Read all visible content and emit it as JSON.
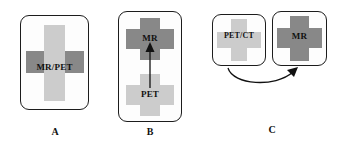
{
  "figure": {
    "background": "#ffffff",
    "colors": {
      "light_gray": "#cccccc",
      "dark_gray": "#888888",
      "outline": "#1c1c1c",
      "text": "#111111",
      "box_fill": "#fdfdfd"
    }
  },
  "panels": [
    {
      "letter": "A",
      "name": "integrated-mr-pet",
      "caption": "A",
      "box": {
        "x": 20,
        "y": 15,
        "w": 69,
        "h": 95
      },
      "crosses": [
        {
          "name": "mr-pet-cross",
          "label": "MR/PET",
          "label_color": "#111111",
          "vertical_color": "#cccccc",
          "horizontal_color": "#888888",
          "order": "vertical-on-top"
        }
      ]
    },
    {
      "letter": "B",
      "name": "sequential-mr-pet",
      "caption": "B",
      "box": {
        "x": 118,
        "y": 11,
        "w": 64,
        "h": 111
      },
      "crosses": [
        {
          "name": "mr-cross",
          "label": "MR",
          "color": "#888888",
          "position": "top"
        },
        {
          "name": "pet-cross",
          "label": "PET",
          "color": "#cccccc",
          "position": "bottom"
        }
      ],
      "arrow": {
        "name": "pet-to-mr-arrow",
        "direction": "up",
        "style": "straight"
      }
    },
    {
      "letter": "C",
      "name": "separate-petct-and-mr",
      "caption": "C",
      "boxes": [
        {
          "name": "petct-box",
          "x": 212,
          "y": 14,
          "w": 54,
          "h": 52
        },
        {
          "name": "mr-box",
          "x": 272,
          "y": 11,
          "w": 55,
          "h": 55
        }
      ],
      "crosses": [
        {
          "name": "petct-cross",
          "label": "PET/CT",
          "color": "#cccccc"
        },
        {
          "name": "mr-cross",
          "label": "MR",
          "color": "#888888"
        }
      ],
      "arrow": {
        "name": "petct-to-mr-arrow",
        "direction": "right",
        "style": "curved"
      }
    }
  ],
  "labels": {
    "mr_pet": "MR/PET",
    "mr": "MR",
    "pet": "PET",
    "pet_ct": "PET/CT",
    "panel_a": "A",
    "panel_b": "B",
    "panel_c": "C"
  }
}
